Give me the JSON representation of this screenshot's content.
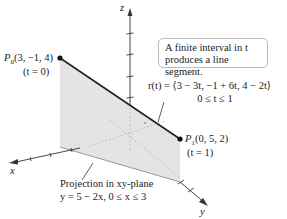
{
  "axes": {
    "x_label": "x",
    "y_label": "y",
    "z_label": "z"
  },
  "points": {
    "p0": {
      "name": "P",
      "sub": "0",
      "coords": "(3, −1, 4)",
      "param": "(t = 0)"
    },
    "p1": {
      "name": "P",
      "sub": "1",
      "coords": "(0, 5, 2)",
      "param": "(t = 1)"
    }
  },
  "callout": {
    "line1": "A finite interval in t",
    "line2": "produces a line segment."
  },
  "equation": {
    "line1": "r(t) = ⟨3 − 3t, −1 + 6t, 4 − 2t⟩",
    "line2": "0 ≤ t ≤ 1"
  },
  "projection": {
    "line1": "Projection in xy-plane",
    "line2": "y = 5 − 2x, 0 ≤ x ≤ 3"
  },
  "colors": {
    "segment": "#222222",
    "plane_fill": "#e6e6e6",
    "axis": "#333333"
  }
}
